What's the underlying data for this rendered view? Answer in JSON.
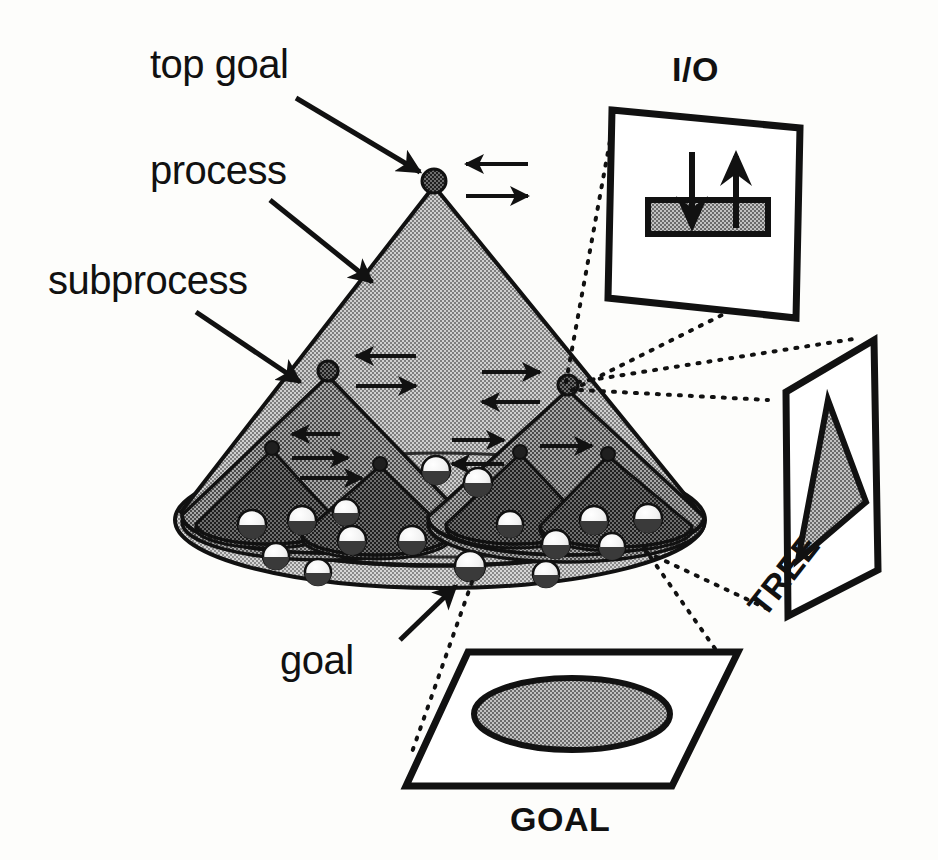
{
  "figure": {
    "background_color": "#fdfdfb",
    "ink_color": "#111111"
  },
  "labels": {
    "top_goal": "top goal",
    "process": "process",
    "subprocess": "subprocess",
    "goal": "goal",
    "io_panel": "I/O",
    "tree_panel": "TREE",
    "goal_panel": "GOAL"
  },
  "palette": {
    "cone_level1_fill": "#b9b9b9",
    "cone_level2_fill": "#8e8e8e",
    "cone_level3_fill": "#5e5e5e",
    "base_ellipse_fill": "#c6c6c6",
    "node_fill": "#2b2b2b",
    "goal_sphere_top": "#ffffff",
    "goal_sphere_bottom": "#3a3a3a",
    "panel_fill": "#ffffff",
    "panel_stroke": "#111111",
    "hatch_fill": "#9a9a9a",
    "outline": "#111111"
  },
  "structure": {
    "levels": 3,
    "top_goal_node": {
      "x": 434,
      "y": 181,
      "radius": 11
    },
    "subprocess_nodes": [
      {
        "x": 328,
        "y": 371,
        "radius": 9
      },
      {
        "x": 568,
        "y": 385,
        "radius": 9
      }
    ],
    "subsubprocess_nodes": [
      {
        "x": 272,
        "y": 446,
        "radius": 6
      },
      {
        "x": 380,
        "y": 462,
        "radius": 6
      },
      {
        "x": 520,
        "y": 450,
        "radius": 6
      },
      {
        "x": 608,
        "y": 452,
        "radius": 6
      }
    ],
    "goal_sphere_count": 18,
    "io_arrow_pairs": 7
  },
  "annotations": {
    "leaders": [
      {
        "from_label": "top goal",
        "to": "top-goal-node"
      },
      {
        "from_label": "process",
        "to": "level1-cone-surface"
      },
      {
        "from_label": "subprocess",
        "to": "left-subcone-surface"
      },
      {
        "from_label": "goal",
        "to": "base-goal-sphere"
      }
    ],
    "dotted_callouts": [
      {
        "source_node": "right-subprocess-node",
        "panel": "I/O"
      },
      {
        "source_node": "right-subprocess-node",
        "panel": "TREE"
      },
      {
        "source_node": "base-region",
        "panel": "GOAL"
      }
    ]
  },
  "panels": {
    "io": {
      "label": "I/O",
      "contents": "hatched bar with one downward input arrow and one upward output arrow",
      "arrows": [
        "input-down",
        "output-up"
      ]
    },
    "tree": {
      "label": "TREE",
      "contents": "hatched triangle representing the process tree",
      "rotation_deg": -52
    },
    "goal": {
      "label": "GOAL",
      "contents": "hatched ellipse representing the goal set on a plane"
    }
  }
}
